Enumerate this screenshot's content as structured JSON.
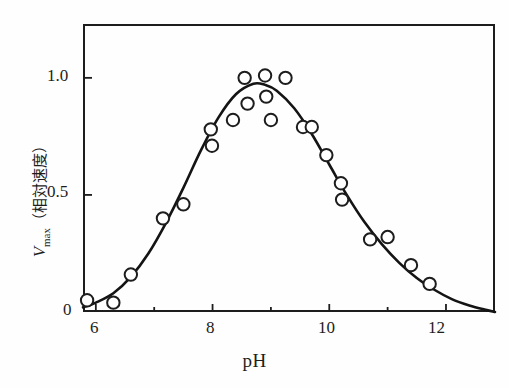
{
  "figure": {
    "x_axis_title": "pH",
    "y_axis_title_symbol": "V",
    "y_axis_title_subscript": "max",
    "y_axis_title_paren": "（相対速度）",
    "y_axis_title_full": "Vmax （相対速度）"
  },
  "axis": {
    "x_ticks": [
      "6",
      "8",
      "10",
      "12"
    ],
    "y_ticks": [
      "0",
      "0.5",
      "1.0"
    ]
  },
  "colors": {
    "axis": "#1d1d1d",
    "curve": "#141414",
    "marker_stroke": "#1d1d1d",
    "marker_fill": "#ffffff",
    "background": "#fefefe"
  },
  "chart_data": {
    "type": "scatter",
    "title": "",
    "xlabel": "pH",
    "ylabel": "Vmax （相対速度）",
    "xlim": [
      5.78,
      12.84
    ],
    "ylim": [
      0.0,
      1.23
    ],
    "xticks": [
      6,
      8,
      10,
      12
    ],
    "xticks_minor": [
      7,
      9,
      11
    ],
    "yticks": [
      0,
      0.5,
      1.0
    ],
    "grid": false,
    "legend": null,
    "series": [
      {
        "name": "Observed relative Vmax",
        "marker": "open-circle",
        "x": [
          5.85,
          6.3,
          6.6,
          7.15,
          7.5,
          7.97,
          7.99,
          8.35,
          8.55,
          8.6,
          8.9,
          8.92,
          9.0,
          9.25,
          9.55,
          9.7,
          9.95,
          10.2,
          10.22,
          10.7,
          11.0,
          11.4,
          11.72
        ],
        "y": [
          0.05,
          0.04,
          0.16,
          0.4,
          0.46,
          0.78,
          0.71,
          0.82,
          1.0,
          0.89,
          1.01,
          0.92,
          0.82,
          1.0,
          0.79,
          0.79,
          0.67,
          0.55,
          0.48,
          0.31,
          0.32,
          0.2,
          0.12
        ]
      },
      {
        "name": "Fitted bell curve",
        "marker": "none",
        "line": "solid",
        "x": [
          5.78,
          6.0,
          6.3,
          6.6,
          6.9,
          7.2,
          7.5,
          7.8,
          8.1,
          8.4,
          8.7,
          8.9,
          9.1,
          9.4,
          9.7,
          10.0,
          10.3,
          10.6,
          10.9,
          11.2,
          11.5,
          11.8,
          12.1,
          12.4,
          12.7,
          12.84
        ],
        "y": [
          0.02,
          0.04,
          0.08,
          0.15,
          0.25,
          0.38,
          0.53,
          0.69,
          0.83,
          0.93,
          0.975,
          0.97,
          0.945,
          0.87,
          0.76,
          0.63,
          0.5,
          0.385,
          0.29,
          0.21,
          0.145,
          0.095,
          0.055,
          0.028,
          0.008,
          0.0
        ]
      }
    ]
  }
}
